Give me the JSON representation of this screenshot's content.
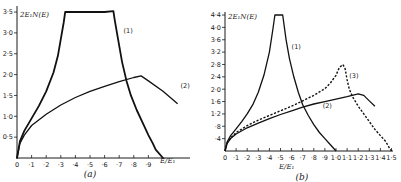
{
  "chart_data": [
    {
      "panel": "(a)",
      "type": "line",
      "ylabel": "2E₁N(E)",
      "xlabel": "E/E₁",
      "xlim": [
        0,
        1.2
      ],
      "ylim": [
        0,
        3.5
      ],
      "xticks": [
        0,
        0.1,
        0.2,
        0.3,
        0.4,
        0.5,
        0.6,
        0.7,
        0.8,
        0.9
      ],
      "xtick_labels": [
        "0",
        "·1",
        "·2",
        "·3",
        "·4",
        "·5",
        "·6",
        "·7",
        "·8",
        "·9"
      ],
      "yticks": [
        0.5,
        1.0,
        1.5,
        2.0,
        2.5,
        3.0,
        3.5
      ],
      "ytick_labels": [
        "0·5",
        "1·0",
        "1·5",
        "2·0",
        "2·5",
        "3·0",
        "3·5"
      ],
      "grid": false,
      "series": [
        {
          "name": "(1)",
          "style": "solid-thick",
          "x": [
            0,
            0.02,
            0.05,
            0.1,
            0.15,
            0.2,
            0.25,
            0.28,
            0.3,
            0.32,
            0.33,
            0.4,
            0.5,
            0.6,
            0.66,
            0.67,
            0.69,
            0.72,
            0.75,
            0.78,
            0.82,
            0.86,
            0.9,
            0.93,
            0.95,
            1.0
          ],
          "y": [
            0,
            0.4,
            0.65,
            0.95,
            1.25,
            1.6,
            2.05,
            2.45,
            2.85,
            3.25,
            3.5,
            3.5,
            3.5,
            3.5,
            3.52,
            3.3,
            2.9,
            2.3,
            1.85,
            1.5,
            1.15,
            0.85,
            0.55,
            0.35,
            0.2,
            0
          ]
        },
        {
          "name": "(2)",
          "style": "solid",
          "x": [
            0,
            0.02,
            0.05,
            0.1,
            0.2,
            0.3,
            0.4,
            0.5,
            0.6,
            0.7,
            0.8,
            0.85,
            0.9,
            1.0,
            1.1
          ],
          "y": [
            0,
            0.35,
            0.55,
            0.78,
            1.05,
            1.27,
            1.45,
            1.6,
            1.72,
            1.83,
            1.93,
            1.97,
            1.85,
            1.6,
            1.3
          ]
        }
      ],
      "annotations": [
        {
          "text": "(1)",
          "x": 0.73,
          "y": 3.0
        },
        {
          "text": "(2)",
          "x": 1.12,
          "y": 1.68
        }
      ]
    },
    {
      "panel": "(b)",
      "type": "line",
      "ylabel": "2E₁N(E)",
      "xlabel": "E/E₁",
      "xlim": [
        0,
        1.5
      ],
      "ylim": [
        0,
        4.4
      ],
      "xticks": [
        0,
        0.1,
        0.2,
        0.3,
        0.4,
        0.5,
        0.6,
        0.7,
        0.8,
        0.9,
        1.0,
        1.1,
        1.2,
        1.3,
        1.4,
        1.5
      ],
      "xtick_labels": [
        "0",
        "·1",
        "·2",
        "·3",
        "·4",
        "·5",
        "·6",
        "·7",
        "·8",
        "·9",
        "1·0",
        "1·1",
        "1·2",
        "1·3",
        "1·4",
        "1·5"
      ],
      "yticks": [
        0.4,
        0.8,
        1.2,
        1.6,
        2.0,
        2.4,
        2.8,
        3.2,
        3.6,
        4.0,
        4.4
      ],
      "ytick_labels": [
        "·4",
        "·8",
        "1·2",
        "1·6",
        "2·0",
        "2·4",
        "2·8",
        "3·2",
        "3·6",
        "4·0",
        "4·4"
      ],
      "grid": false,
      "series": [
        {
          "name": "(1)",
          "style": "solid",
          "x": [
            0,
            0.02,
            0.05,
            0.1,
            0.15,
            0.2,
            0.25,
            0.3,
            0.35,
            0.4,
            0.43,
            0.45,
            0.52,
            0.55,
            0.58,
            0.62,
            0.66,
            0.7,
            0.75,
            0.8,
            0.85,
            0.9,
            0.95,
            0.98,
            1.0
          ],
          "y": [
            0,
            0.3,
            0.5,
            0.72,
            0.95,
            1.2,
            1.5,
            1.9,
            2.45,
            3.2,
            3.9,
            4.4,
            4.4,
            3.6,
            3.0,
            2.4,
            1.9,
            1.5,
            1.15,
            0.85,
            0.6,
            0.4,
            0.2,
            0.08,
            0
          ]
        },
        {
          "name": "(2)",
          "style": "solid",
          "x": [
            0,
            0.02,
            0.05,
            0.1,
            0.2,
            0.3,
            0.4,
            0.5,
            0.6,
            0.7,
            0.8,
            0.9,
            1.0,
            1.1,
            1.2,
            1.25,
            1.3,
            1.35
          ],
          "y": [
            0,
            0.25,
            0.4,
            0.55,
            0.75,
            0.9,
            1.05,
            1.18,
            1.3,
            1.42,
            1.52,
            1.6,
            1.68,
            1.76,
            1.85,
            1.8,
            1.62,
            1.45
          ]
        },
        {
          "name": "(3)",
          "style": "dashed",
          "x": [
            0,
            0.02,
            0.05,
            0.1,
            0.2,
            0.3,
            0.4,
            0.5,
            0.6,
            0.7,
            0.8,
            0.9,
            0.95,
            1.0,
            1.03,
            1.06,
            1.08,
            1.1,
            1.12,
            1.15,
            1.2,
            1.25,
            1.3,
            1.35,
            1.4,
            1.45,
            1.48,
            1.5
          ],
          "y": [
            0,
            0.27,
            0.42,
            0.6,
            0.82,
            1.0,
            1.15,
            1.3,
            1.45,
            1.62,
            1.8,
            2.02,
            2.2,
            2.45,
            2.7,
            2.8,
            2.7,
            2.3,
            2.0,
            1.75,
            1.45,
            1.2,
            0.95,
            0.7,
            0.5,
            0.3,
            0.1,
            0
          ]
        }
      ],
      "annotations": [
        {
          "text": "(1)",
          "x": 0.6,
          "y": 3.3
        },
        {
          "text": "(2)",
          "x": 0.88,
          "y": 1.4
        },
        {
          "text": "(3)",
          "x": 1.12,
          "y": 2.35
        }
      ]
    }
  ],
  "panels": {
    "a": {
      "label": "(a)",
      "ylabel": "2E₁N(E)",
      "xlabel": "E/E₁"
    },
    "b": {
      "label": "(b)",
      "ylabel": "2E₁N(E)",
      "xlabel": "E/E₁"
    }
  }
}
